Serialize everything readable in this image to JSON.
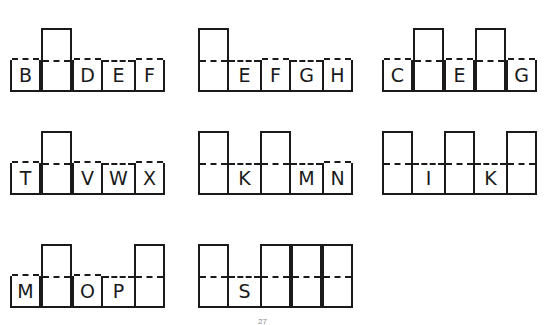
{
  "puzzles": [
    {
      "x": 10,
      "y": 12,
      "cells": [
        {
          "type": "short",
          "letter": "B"
        },
        {
          "type": "tall",
          "letter": ""
        },
        {
          "type": "short",
          "letter": "D"
        },
        {
          "type": "open",
          "letter": "E"
        },
        {
          "type": "short",
          "letter": "F"
        }
      ]
    },
    {
      "x": 198,
      "y": 12,
      "cells": [
        {
          "type": "tall",
          "letter": ""
        },
        {
          "type": "open",
          "letter": "E"
        },
        {
          "type": "short",
          "letter": "F"
        },
        {
          "type": "open",
          "letter": "G"
        },
        {
          "type": "short",
          "letter": "H"
        }
      ]
    },
    {
      "x": 382,
      "y": 12,
      "cells": [
        {
          "type": "short",
          "letter": "C"
        },
        {
          "type": "tall",
          "letter": ""
        },
        {
          "type": "short",
          "letter": "E"
        },
        {
          "type": "tall",
          "letter": ""
        },
        {
          "type": "short",
          "letter": "G"
        }
      ]
    },
    {
      "x": 10,
      "y": 115,
      "cells": [
        {
          "type": "short",
          "letter": "T"
        },
        {
          "type": "tall",
          "letter": ""
        },
        {
          "type": "short",
          "letter": "V"
        },
        {
          "type": "open",
          "letter": "W"
        },
        {
          "type": "short",
          "letter": "X"
        }
      ]
    },
    {
      "x": 198,
      "y": 115,
      "cells": [
        {
          "type": "tall",
          "letter": ""
        },
        {
          "type": "open",
          "letter": "K"
        },
        {
          "type": "tall",
          "letter": ""
        },
        {
          "type": "open",
          "letter": "M"
        },
        {
          "type": "short",
          "letter": "N"
        }
      ]
    },
    {
      "x": 382,
      "y": 115,
      "cells": [
        {
          "type": "tall",
          "letter": ""
        },
        {
          "type": "open",
          "letter": "I"
        },
        {
          "type": "tall",
          "letter": ""
        },
        {
          "type": "open",
          "letter": "K"
        },
        {
          "type": "tall",
          "letter": ""
        }
      ]
    },
    {
      "x": 10,
      "y": 228,
      "cells": [
        {
          "type": "short",
          "letter": "M"
        },
        {
          "type": "tall",
          "letter": ""
        },
        {
          "type": "short",
          "letter": "O"
        },
        {
          "type": "open",
          "letter": "P"
        },
        {
          "type": "tall",
          "letter": ""
        }
      ]
    },
    {
      "x": 198,
      "y": 228,
      "cells": [
        {
          "type": "tall",
          "letter": ""
        },
        {
          "type": "open",
          "letter": "S"
        },
        {
          "type": "tall",
          "letter": ""
        },
        {
          "type": "tall",
          "letter": ""
        },
        {
          "type": "tall",
          "letter": ""
        }
      ]
    }
  ],
  "page_number": "27"
}
